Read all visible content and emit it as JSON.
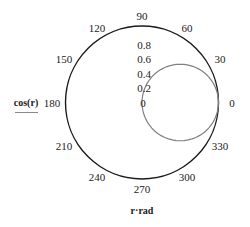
{
  "chart_data": {
    "type": "polar-line",
    "title": "",
    "series": [
      {
        "name": "cos(r)",
        "expression": "cos(r)",
        "color": "#808080",
        "theta_deg": [
          0,
          15,
          30,
          45,
          60,
          75,
          90,
          105,
          120,
          135,
          150,
          165,
          180,
          195,
          210,
          225,
          240,
          255,
          270,
          285,
          300,
          315,
          330,
          345,
          360
        ],
        "r": [
          1.0,
          0.966,
          0.866,
          0.707,
          0.5,
          0.259,
          0.0,
          -0.259,
          -0.5,
          -0.707,
          -0.866,
          -0.966,
          -1.0,
          -0.966,
          -0.866,
          -0.707,
          -0.5,
          -0.259,
          0.0,
          0.259,
          0.5,
          0.707,
          0.866,
          0.966,
          1.0
        ]
      }
    ],
    "angular_axis": {
      "label": "r·rad",
      "unit": "degrees",
      "ticks": [
        "0",
        "30",
        "60",
        "90",
        "120",
        "150",
        "180",
        "210",
        "240",
        "270",
        "300",
        "330"
      ]
    },
    "radial_axis": {
      "label": "cos(r)",
      "range": [
        0,
        1
      ],
      "ticks": [
        "0",
        "0.2",
        "0.4",
        "0.6",
        "0.8"
      ]
    },
    "outer_circle_color": "#1a1a1a",
    "grid": false,
    "legend": "left (y-axis label with line sample)"
  },
  "labels": {
    "ylabel": "cos(r)",
    "xlabel": "r·rad"
  }
}
